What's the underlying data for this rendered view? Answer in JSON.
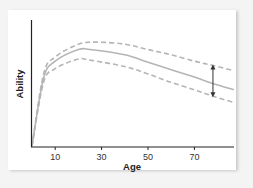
{
  "chart_data": {
    "type": "line",
    "title": "",
    "xlabel": "Age",
    "ylabel": "Ability",
    "x_ticks": [
      10,
      30,
      50,
      70
    ],
    "xlim": [
      0,
      87
    ],
    "y_ticks": [],
    "grid": false,
    "legend": "none",
    "series": [
      {
        "name": "upper bound",
        "style": "dashed",
        "color": "#b5b5b5",
        "x": [
          0,
          5,
          10,
          20,
          28,
          40,
          50,
          60,
          70,
          78,
          87
        ],
        "y": [
          0,
          68,
          84,
          96,
          98,
          96,
          91,
          86,
          80,
          76,
          71
        ]
      },
      {
        "name": "mean ability",
        "style": "solid",
        "color": "#b5b5b5",
        "x": [
          0,
          5,
          10,
          20,
          25,
          40,
          50,
          60,
          70,
          78,
          87
        ],
        "y": [
          0,
          64,
          80,
          91,
          91,
          86,
          79,
          72,
          65,
          59,
          53
        ]
      },
      {
        "name": "lower bound",
        "style": "dashed",
        "color": "#b5b5b5",
        "x": [
          0,
          5,
          10,
          20,
          25,
          40,
          50,
          60,
          70,
          78,
          87
        ],
        "y": [
          0,
          60,
          73,
          82,
          81,
          75,
          68,
          60,
          53,
          47,
          41
        ]
      }
    ],
    "annotations": [
      {
        "type": "double-arrow",
        "x": 78,
        "y_from": 76,
        "y_to": 47,
        "meaning": "spread of ability"
      }
    ]
  },
  "labels": {
    "xlabel": "Age",
    "ylabel": "Ability",
    "ticks": [
      "10",
      "30",
      "50",
      "70"
    ]
  }
}
